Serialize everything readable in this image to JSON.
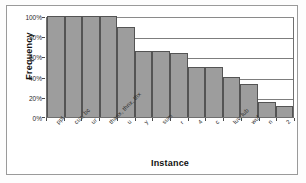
{
  "chart_data": {
    "type": "bar",
    "title": "",
    "xlabel": "Instance",
    "ylabel": "Frequency",
    "grid": true,
    "legend": false,
    "ylim": [
      0,
      100
    ],
    "ytick_labels": [
      "100%",
      "80%",
      "60%",
      "40%",
      "20%",
      "0%"
    ],
    "ytick_values": [
      100,
      80,
      60,
      40,
      20,
      0
    ],
    "categories": [
      "ppl",
      "cuz, bc",
      "ur",
      "thanx, thnx, thx",
      "u",
      "y",
      "sum",
      "r",
      "4",
      "c",
      "luv, lub",
      "wuf",
      "n",
      "2"
    ],
    "values": [
      100,
      100,
      100,
      100,
      89,
      65,
      65,
      63,
      50,
      50,
      40,
      33,
      15,
      11
    ],
    "value_labels": [
      "100%",
      "100%",
      "100%",
      "100%",
      "89%",
      "65%",
      "65%",
      "63%",
      "50%",
      "50%",
      "40%",
      "33%",
      "15%",
      "11%"
    ],
    "bar_fill": "#9d9d9d",
    "bar_edge": "#545454",
    "plot_background": "#ffffff",
    "gridline_color": "#7d7d7d",
    "frame_color": "#9a9a9a"
  }
}
